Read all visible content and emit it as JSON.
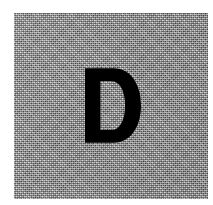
{
  "image": {
    "kind": "scanned-letter-swatch",
    "canvas_width": 213,
    "canvas_height": 205,
    "page_background_color": "#ffffff",
    "alt_text": "Scanned gray square containing a single bold black capital letter D"
  },
  "swatch": {
    "label": "gray-tile",
    "fill_color": "#9c9c9c",
    "texture": "halftone-dither",
    "left": 14,
    "top": 13,
    "width": 194,
    "height": 186
  },
  "letter": {
    "character": "D",
    "color": "#000000",
    "weight": "bold",
    "style": "sans-serif",
    "left": 85,
    "top": 68,
    "width": 56,
    "height": 75
  }
}
